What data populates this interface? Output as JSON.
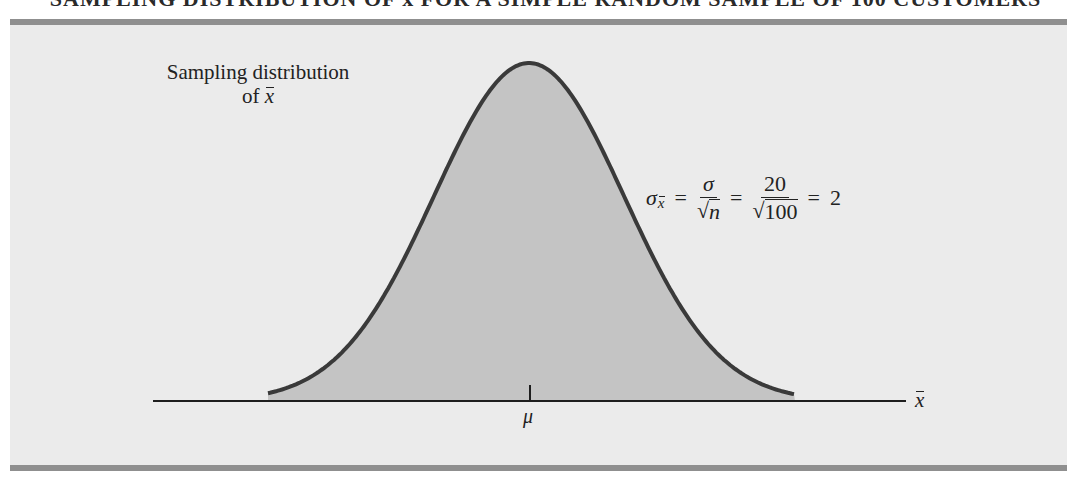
{
  "figure": {
    "title_cropped": "SAMPLING DISTRIBUTION OF x̄ FOR A SIMPLE RANDOM SAMPLE OF 100 CUSTOMERS",
    "distribution_label": {
      "line1": "Sampling distribution",
      "line2_prefix": "of ",
      "line2_symbol": "x"
    },
    "formula": {
      "lhs_symbol": "σ",
      "lhs_subscript": "x",
      "eq1": "=",
      "frac1_num": "σ",
      "frac1_den_radical": "√",
      "frac1_den_radicand": "n",
      "eq2": "=",
      "frac2_num": "20",
      "frac2_den_radical": "√",
      "frac2_den_radicand": "100",
      "eq3": "=",
      "result": "2"
    },
    "mean_label": "μ",
    "axis_label": "x"
  },
  "colors": {
    "panel_bg": "#ebebeb",
    "rule": "#8f8f8f",
    "curve_fill": "#c4c4c4",
    "curve_stroke": "#3a3a3a",
    "axis": "#1e1e1e"
  },
  "chart_data": {
    "type": "area",
    "title": "Sampling distribution of x̄",
    "xlabel": "x̄",
    "ylabel": "",
    "center_label": "μ",
    "distribution": "normal",
    "parameters": {
      "sigma": 20,
      "n": 100,
      "standard_error": 2
    },
    "annotation": "σ_x̄ = σ/√n = 20/√100 = 2",
    "grid": false,
    "legend": "none"
  }
}
